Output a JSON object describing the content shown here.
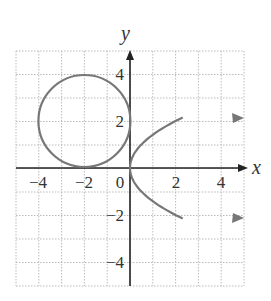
{
  "chart_data": {
    "type": "line",
    "title": "",
    "xlabel": "x",
    "ylabel": "y",
    "xlim": [
      -5,
      5
    ],
    "ylim": [
      -5,
      5
    ],
    "grid": true,
    "x_ticks": [
      -4,
      -2,
      0,
      2,
      4
    ],
    "y_ticks": [
      -4,
      -2,
      2,
      4
    ],
    "tick_labels": {
      "x": [
        "−4",
        "−2",
        "0",
        "2",
        "4"
      ],
      "y": [
        "4",
        "2",
        "−2",
        "−4"
      ]
    },
    "series": [
      {
        "name": "circle",
        "kind": "circle",
        "center": [
          -2,
          2
        ],
        "radius": 2,
        "equation": "(x+2)^2 + (y-2)^2 = 4"
      },
      {
        "name": "parabola",
        "kind": "parabola",
        "equation": "x = y^2 / 2",
        "vertex": [
          0,
          0
        ],
        "endpoints": [
          [
            4.8,
            2.2
          ],
          [
            4.8,
            -2.2
          ]
        ],
        "arrows": true
      }
    ],
    "colors": {
      "curve": "#777777",
      "axis": "#222222",
      "grid": "#bbbbbb"
    }
  }
}
